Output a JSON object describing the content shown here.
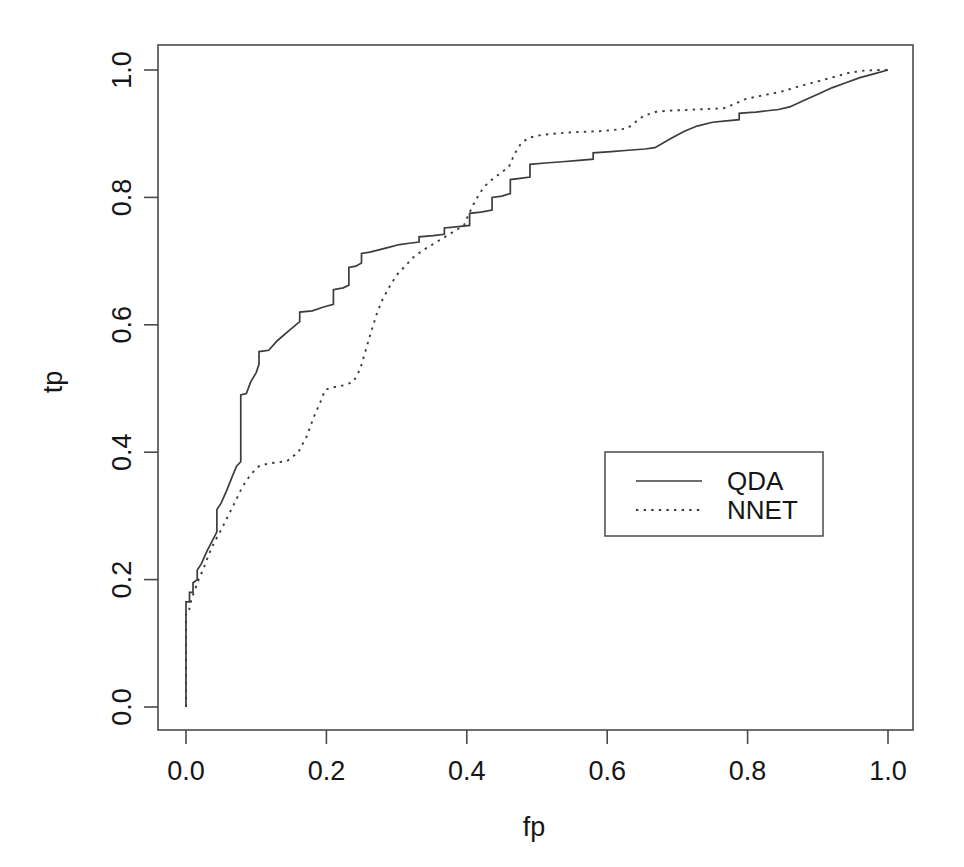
{
  "chart_data": {
    "type": "line",
    "title": "",
    "xlabel": "fp",
    "ylabel": "tp",
    "xlim": [
      0.0,
      1.0
    ],
    "ylim": [
      0.0,
      1.0
    ],
    "grid": false,
    "legend_position": "center-right",
    "x_ticks": [
      "0.0",
      "0.2",
      "0.4",
      "0.6",
      "0.8",
      "1.0"
    ],
    "x_tick_values": [
      0.0,
      0.2,
      0.4,
      0.6,
      0.8,
      1.0
    ],
    "y_ticks": [
      "0.0",
      "0.2",
      "0.4",
      "0.6",
      "0.8",
      "1.0"
    ],
    "y_tick_values": [
      0.0,
      0.2,
      0.4,
      0.6,
      0.8,
      1.0
    ],
    "series": [
      {
        "name": "QDA",
        "linestyle": "solid",
        "color": "#3c3c3c",
        "points": [
          [
            0.0,
            0.0
          ],
          [
            0.0,
            0.165
          ],
          [
            0.005,
            0.165
          ],
          [
            0.005,
            0.18
          ],
          [
            0.01,
            0.18
          ],
          [
            0.01,
            0.195
          ],
          [
            0.016,
            0.2
          ],
          [
            0.016,
            0.215
          ],
          [
            0.022,
            0.225
          ],
          [
            0.03,
            0.245
          ],
          [
            0.038,
            0.262
          ],
          [
            0.044,
            0.275
          ],
          [
            0.044,
            0.31
          ],
          [
            0.05,
            0.32
          ],
          [
            0.058,
            0.34
          ],
          [
            0.066,
            0.362
          ],
          [
            0.072,
            0.378
          ],
          [
            0.078,
            0.385
          ],
          [
            0.078,
            0.49
          ],
          [
            0.086,
            0.492
          ],
          [
            0.092,
            0.51
          ],
          [
            0.1,
            0.525
          ],
          [
            0.104,
            0.538
          ],
          [
            0.104,
            0.558
          ],
          [
            0.118,
            0.56
          ],
          [
            0.13,
            0.575
          ],
          [
            0.148,
            0.592
          ],
          [
            0.162,
            0.605
          ],
          [
            0.162,
            0.62
          ],
          [
            0.18,
            0.622
          ],
          [
            0.196,
            0.628
          ],
          [
            0.21,
            0.632
          ],
          [
            0.21,
            0.655
          ],
          [
            0.224,
            0.658
          ],
          [
            0.232,
            0.662
          ],
          [
            0.232,
            0.69
          ],
          [
            0.242,
            0.692
          ],
          [
            0.25,
            0.697
          ],
          [
            0.25,
            0.712
          ],
          [
            0.262,
            0.714
          ],
          [
            0.276,
            0.718
          ],
          [
            0.29,
            0.722
          ],
          [
            0.304,
            0.726
          ],
          [
            0.318,
            0.728
          ],
          [
            0.332,
            0.73
          ],
          [
            0.332,
            0.738
          ],
          [
            0.352,
            0.74
          ],
          [
            0.368,
            0.742
          ],
          [
            0.368,
            0.752
          ],
          [
            0.388,
            0.754
          ],
          [
            0.404,
            0.756
          ],
          [
            0.404,
            0.775
          ],
          [
            0.42,
            0.777
          ],
          [
            0.436,
            0.78
          ],
          [
            0.436,
            0.8
          ],
          [
            0.45,
            0.802
          ],
          [
            0.462,
            0.806
          ],
          [
            0.462,
            0.828
          ],
          [
            0.476,
            0.83
          ],
          [
            0.49,
            0.832
          ],
          [
            0.49,
            0.852
          ],
          [
            0.512,
            0.854
          ],
          [
            0.536,
            0.856
          ],
          [
            0.56,
            0.858
          ],
          [
            0.58,
            0.86
          ],
          [
            0.58,
            0.87
          ],
          [
            0.606,
            0.872
          ],
          [
            0.63,
            0.874
          ],
          [
            0.654,
            0.876
          ],
          [
            0.668,
            0.878
          ],
          [
            0.69,
            0.892
          ],
          [
            0.71,
            0.904
          ],
          [
            0.728,
            0.912
          ],
          [
            0.75,
            0.918
          ],
          [
            0.77,
            0.92
          ],
          [
            0.788,
            0.922
          ],
          [
            0.788,
            0.932
          ],
          [
            0.8,
            0.933
          ],
          [
            0.812,
            0.934
          ],
          [
            0.828,
            0.936
          ],
          [
            0.844,
            0.938
          ],
          [
            0.86,
            0.942
          ],
          [
            0.88,
            0.952
          ],
          [
            0.9,
            0.962
          ],
          [
            0.92,
            0.972
          ],
          [
            0.94,
            0.98
          ],
          [
            0.96,
            0.988
          ],
          [
            0.98,
            0.994
          ],
          [
            1.0,
            1.0
          ]
        ]
      },
      {
        "name": "NNET",
        "linestyle": "dotted",
        "color": "#3c3c3c",
        "points": [
          [
            0.0,
            0.0
          ],
          [
            0.0,
            0.148
          ],
          [
            0.004,
            0.15
          ],
          [
            0.008,
            0.17
          ],
          [
            0.012,
            0.182
          ],
          [
            0.018,
            0.2
          ],
          [
            0.024,
            0.215
          ],
          [
            0.032,
            0.238
          ],
          [
            0.04,
            0.258
          ],
          [
            0.05,
            0.278
          ],
          [
            0.06,
            0.3
          ],
          [
            0.07,
            0.322
          ],
          [
            0.08,
            0.345
          ],
          [
            0.092,
            0.365
          ],
          [
            0.104,
            0.378
          ],
          [
            0.116,
            0.382
          ],
          [
            0.13,
            0.384
          ],
          [
            0.144,
            0.386
          ],
          [
            0.16,
            0.4
          ],
          [
            0.172,
            0.425
          ],
          [
            0.182,
            0.455
          ],
          [
            0.192,
            0.48
          ],
          [
            0.198,
            0.498
          ],
          [
            0.21,
            0.502
          ],
          [
            0.224,
            0.505
          ],
          [
            0.238,
            0.51
          ],
          [
            0.248,
            0.53
          ],
          [
            0.256,
            0.56
          ],
          [
            0.264,
            0.59
          ],
          [
            0.272,
            0.618
          ],
          [
            0.28,
            0.64
          ],
          [
            0.29,
            0.66
          ],
          [
            0.3,
            0.678
          ],
          [
            0.312,
            0.692
          ],
          [
            0.324,
            0.706
          ],
          [
            0.336,
            0.716
          ],
          [
            0.348,
            0.724
          ],
          [
            0.36,
            0.732
          ],
          [
            0.372,
            0.74
          ],
          [
            0.384,
            0.748
          ],
          [
            0.396,
            0.756
          ],
          [
            0.402,
            0.772
          ],
          [
            0.41,
            0.79
          ],
          [
            0.418,
            0.806
          ],
          [
            0.426,
            0.818
          ],
          [
            0.436,
            0.828
          ],
          [
            0.448,
            0.838
          ],
          [
            0.46,
            0.848
          ],
          [
            0.468,
            0.868
          ],
          [
            0.478,
            0.886
          ],
          [
            0.49,
            0.894
          ],
          [
            0.506,
            0.898
          ],
          [
            0.524,
            0.9
          ],
          [
            0.546,
            0.902
          ],
          [
            0.568,
            0.903
          ],
          [
            0.59,
            0.904
          ],
          [
            0.61,
            0.906
          ],
          [
            0.628,
            0.908
          ],
          [
            0.64,
            0.918
          ],
          [
            0.652,
            0.928
          ],
          [
            0.668,
            0.934
          ],
          [
            0.686,
            0.936
          ],
          [
            0.706,
            0.937
          ],
          [
            0.726,
            0.938
          ],
          [
            0.746,
            0.939
          ],
          [
            0.766,
            0.94
          ],
          [
            0.78,
            0.946
          ],
          [
            0.796,
            0.954
          ],
          [
            0.812,
            0.958
          ],
          [
            0.83,
            0.962
          ],
          [
            0.848,
            0.966
          ],
          [
            0.866,
            0.972
          ],
          [
            0.886,
            0.978
          ],
          [
            0.906,
            0.984
          ],
          [
            0.926,
            0.99
          ],
          [
            0.946,
            0.996
          ],
          [
            0.966,
            0.999
          ],
          [
            0.984,
            1.0
          ],
          [
            1.0,
            1.0
          ]
        ]
      }
    ]
  },
  "legend": {
    "entries": [
      {
        "label": "QDA",
        "style": "solid"
      },
      {
        "label": "NNET",
        "style": "dotted"
      }
    ]
  },
  "axes": {
    "x_title": "fp",
    "y_title": "tp"
  }
}
